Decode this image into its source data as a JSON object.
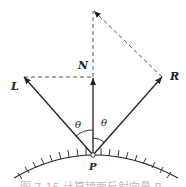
{
  "diagram": {
    "labels": {
      "L": "L",
      "N": "N",
      "R": "R",
      "P": "P",
      "theta_left": "θ",
      "theta_right": "θ"
    },
    "caption": "图 7-15 计算镜面反射向量 R",
    "colors": {
      "line": "#222222",
      "dashed": "#555555",
      "background": "#ffffff"
    }
  }
}
